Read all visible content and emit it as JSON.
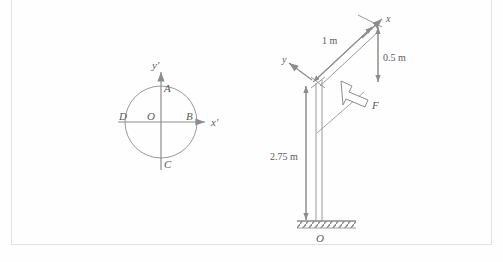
{
  "figure": {
    "background_color": "#fefefe",
    "stroke_color": "#8c8c8c",
    "text_color": "#5b5b5b",
    "frame_color": "#e3e3e3"
  },
  "left_diagram": {
    "name": "circle-axes-diagram",
    "axis_x_label": "x′",
    "axis_y_label": "y′",
    "points": {
      "top": "A",
      "right": "B",
      "bottom": "C",
      "left": "D",
      "center": "O"
    }
  },
  "right_diagram": {
    "name": "pole-arm-diagram",
    "axis_x_label": "x",
    "axis_y_label": "y",
    "force_label": "F",
    "support_label": "O",
    "dimensions": [
      {
        "id": "arm-length",
        "value": "1 m"
      },
      {
        "id": "vertical-offset",
        "value": "0.5 m"
      },
      {
        "id": "pole-height",
        "value": "2.75 m"
      }
    ]
  }
}
